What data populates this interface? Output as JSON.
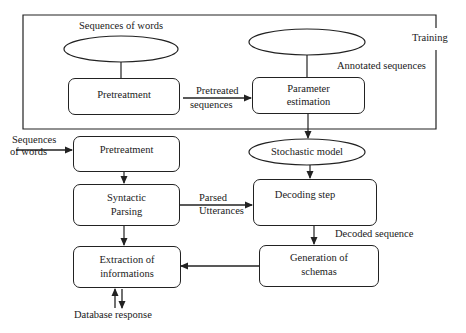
{
  "diagram": {
    "training_frame": {
      "label": "Training"
    },
    "training": {
      "input_ellipse_label": "Sequences of words",
      "pretreatment_box": "Pretreatment",
      "pretreated_edge": [
        "Pretreated",
        "sequences"
      ],
      "annotated_ellipse_label": "Annotated sequences",
      "parameter_box": [
        "Parameter",
        "estimation"
      ]
    },
    "model": {
      "ellipse_label": "Stochastic model"
    },
    "decoding": {
      "input_label": [
        "Sequences",
        "of words"
      ],
      "pretreatment_box": "Pretreatment",
      "syntactic_box": [
        "Syntactic",
        "Parsing"
      ],
      "parsed_edge": [
        "Parsed",
        "Utterances"
      ],
      "decoding_box": "Decoding step",
      "decoded_edge": "Decoded sequence",
      "generation_box": [
        "Generation of",
        "schemas"
      ],
      "extraction_box": [
        "Extraction of",
        "informations"
      ],
      "database_label": "Database response"
    },
    "colors": {
      "stroke": "#222222",
      "text": "#1a1a1a",
      "background": "#ffffff"
    }
  }
}
